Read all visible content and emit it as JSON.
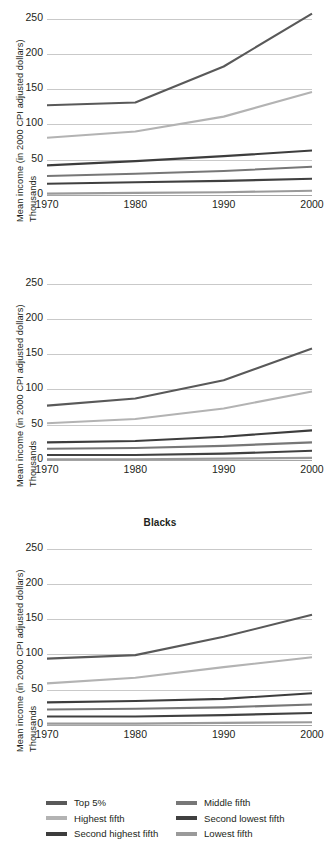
{
  "axis": {
    "y_title_line1": "Mean income (in 2000 CPI adjusted dollars)",
    "y_title_line2": "Thousands",
    "y_ticks": [
      "250",
      "200",
      "150",
      "100",
      "50",
      "0"
    ],
    "x_ticks": [
      "1970",
      "1980",
      "1990",
      "2000"
    ]
  },
  "titles": {
    "panel1": "",
    "panel2": "Blacks",
    "panel3": "Hispanics"
  },
  "legend": {
    "column1": [
      {
        "label": "Top 5%",
        "color": "#595959"
      },
      {
        "label": "Highest fifth",
        "color": "#b3b3b3"
      },
      {
        "label": "Second highest fifth",
        "color": "#3d3d3d"
      }
    ],
    "column2": [
      {
        "label": "Middle fifth",
        "color": "#777777"
      },
      {
        "label": "Second lowest fifth",
        "color": "#404040"
      },
      {
        "label": "Lowest fifth",
        "color": "#9a9a9a"
      }
    ]
  },
  "colors": {
    "gridline": "#c9c9c9",
    "axis": "#a6a6a6",
    "text": "#231f20",
    "background": "#ffffff"
  },
  "chart_data": [
    {
      "type": "line",
      "title": "",
      "xlabel": "",
      "ylabel": "Mean income (in 2000 CPI adjusted dollars) Thousands",
      "x": [
        1970,
        1980,
        1990,
        2000
      ],
      "xlim": [
        1970,
        2000
      ],
      "ylim": [
        0,
        262
      ],
      "yticks": [
        0,
        50,
        100,
        150,
        200,
        250
      ],
      "grid": true,
      "legend_position": "bottom-shared",
      "series": [
        {
          "name": "Top 5%",
          "color": "#595959",
          "values": [
            127,
            131,
            182,
            257
          ]
        },
        {
          "name": "Highest fifth",
          "color": "#b3b3b3",
          "values": [
            81,
            90,
            111,
            146
          ]
        },
        {
          "name": "Second highest fifth",
          "color": "#3d3d3d",
          "values": [
            42,
            48,
            55,
            63
          ]
        },
        {
          "name": "Middle fifth",
          "color": "#777777",
          "values": [
            27,
            30,
            34,
            40
          ]
        },
        {
          "name": "Second lowest fifth",
          "color": "#404040",
          "values": [
            16,
            18,
            20,
            23
          ]
        },
        {
          "name": "Lowest fifth",
          "color": "#9a9a9a",
          "values": [
            2,
            3,
            4,
            6
          ]
        }
      ]
    },
    {
      "type": "line",
      "title": "Blacks",
      "xlabel": "",
      "ylabel": "Mean income (in 2000 CPI adjusted dollars) Thousands",
      "x": [
        1970,
        1980,
        1990,
        2000
      ],
      "xlim": [
        1970,
        2000
      ],
      "ylim": [
        0,
        262
      ],
      "yticks": [
        0,
        50,
        100,
        150,
        200,
        250
      ],
      "grid": true,
      "legend_position": "bottom-shared",
      "series": [
        {
          "name": "Top 5%",
          "color": "#595959",
          "values": [
            77,
            87,
            113,
            158
          ]
        },
        {
          "name": "Highest fifth",
          "color": "#b3b3b3",
          "values": [
            52,
            58,
            73,
            97
          ]
        },
        {
          "name": "Second highest fifth",
          "color": "#3d3d3d",
          "values": [
            25,
            27,
            33,
            42
          ]
        },
        {
          "name": "Middle fifth",
          "color": "#777777",
          "values": [
            16,
            17,
            20,
            25
          ]
        },
        {
          "name": "Second lowest fifth",
          "color": "#404040",
          "values": [
            7,
            7,
            9,
            13
          ]
        },
        {
          "name": "Lowest fifth",
          "color": "#9a9a9a",
          "values": [
            1,
            1,
            2,
            3
          ]
        }
      ]
    },
    {
      "type": "line",
      "title": "Hispanics",
      "xlabel": "",
      "ylabel": "Mean income (in 2000 CPI adjusted dollars) Thousands",
      "x": [
        1970,
        1980,
        1990,
        2000
      ],
      "xlim": [
        1970,
        2000
      ],
      "ylim": [
        0,
        262
      ],
      "yticks": [
        0,
        50,
        100,
        150,
        200,
        250
      ],
      "grid": true,
      "legend_position": "bottom-shared",
      "series": [
        {
          "name": "Top 5%",
          "color": "#595959",
          "values": [
            94,
            99,
            125,
            156
          ]
        },
        {
          "name": "Highest fifth",
          "color": "#b3b3b3",
          "values": [
            59,
            67,
            82,
            96
          ]
        },
        {
          "name": "Second highest fifth",
          "color": "#3d3d3d",
          "values": [
            32,
            34,
            37,
            45
          ]
        },
        {
          "name": "Middle fifth",
          "color": "#777777",
          "values": [
            22,
            23,
            25,
            29
          ]
        },
        {
          "name": "Second lowest fifth",
          "color": "#404040",
          "values": [
            12,
            12,
            14,
            17
          ]
        },
        {
          "name": "Lowest fifth",
          "color": "#9a9a9a",
          "values": [
            2,
            2,
            3,
            4
          ]
        }
      ]
    }
  ]
}
